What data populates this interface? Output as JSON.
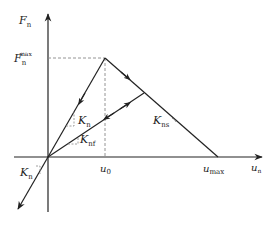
{
  "diagram": {
    "type": "force-displacement constitutive model",
    "axes": {
      "y_label": {
        "main": "F",
        "sub": "n"
      },
      "x_label": {
        "main": "u",
        "sub": "n"
      }
    },
    "tick_labels": {
      "fmax": {
        "main": "F",
        "sub": "n",
        "sup": "max"
      },
      "u0": {
        "main": "u",
        "sub": "0"
      },
      "umax": {
        "main": "u",
        "sub": "max"
      }
    },
    "stiffness_labels": {
      "kn_upper": {
        "main": "K",
        "sub": "n"
      },
      "knf": {
        "main": "K",
        "sub": "nf"
      },
      "kns": {
        "main": "K",
        "sub": "ns"
      },
      "kn_lower": {
        "main": "K",
        "sub": "n"
      }
    },
    "segments": [
      {
        "name": "loading-elastic",
        "from": "origin",
        "to": "peak",
        "stiffness": "K_n"
      },
      {
        "name": "softening",
        "from": "peak",
        "to": "u_max",
        "stiffness": "K_ns"
      },
      {
        "name": "unload-reload",
        "from": "origin",
        "to": "softening-point",
        "stiffness": "K_nf"
      },
      {
        "name": "compression",
        "from": "origin",
        "to": "negative",
        "stiffness": "K_n"
      }
    ],
    "colors": {
      "line": "#222222",
      "dashed": "#888888"
    }
  }
}
